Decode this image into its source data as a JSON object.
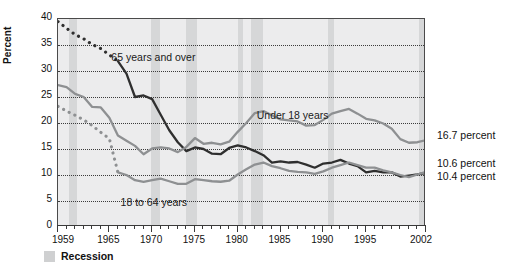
{
  "chart_data": {
    "type": "line",
    "title": "",
    "xlabel": "",
    "ylabel": "Percent",
    "ylim": [
      0,
      40
    ],
    "xlim": [
      1959,
      2002
    ],
    "ytick_labels": [
      "0",
      "5",
      "10",
      "15",
      "20",
      "25",
      "30",
      "35",
      "40"
    ],
    "ytick_values": [
      0,
      5,
      10,
      15,
      20,
      25,
      30,
      35,
      40
    ],
    "xtick_labels": [
      "1959",
      "1965",
      "1970",
      "1975",
      "1980",
      "1985",
      "1990",
      "1995",
      "2002"
    ],
    "xtick_values": [
      1959,
      1965,
      1970,
      1975,
      1980,
      1985,
      1990,
      1995,
      2002
    ],
    "grid": "horizontal-dotted",
    "legend_position": "below-axis",
    "x": [
      1959,
      1960,
      1961,
      1962,
      1963,
      1964,
      1965,
      1966,
      1967,
      1968,
      1969,
      1970,
      1971,
      1972,
      1973,
      1974,
      1975,
      1976,
      1977,
      1978,
      1979,
      1980,
      1981,
      1982,
      1983,
      1984,
      1985,
      1986,
      1987,
      1988,
      1989,
      1990,
      1991,
      1992,
      1993,
      1994,
      1995,
      1996,
      1997,
      1998,
      1999,
      2000,
      2001,
      2002
    ],
    "series": [
      {
        "name": "65 years and over",
        "color": "#2f2f2f",
        "style": "dotted-then-solid",
        "solid_from": 1966,
        "values": [
          39.5,
          38.2,
          37.0,
          36.2,
          35.1,
          34.3,
          33.1,
          31.9,
          29.5,
          25.0,
          25.3,
          24.6,
          21.6,
          18.6,
          16.3,
          14.6,
          15.3,
          15.0,
          14.1,
          14.0,
          15.2,
          15.7,
          15.3,
          14.6,
          13.8,
          12.4,
          12.6,
          12.4,
          12.5,
          12.0,
          11.4,
          12.2,
          12.4,
          12.9,
          12.2,
          11.7,
          10.5,
          10.8,
          10.5,
          10.5,
          9.7,
          9.9,
          10.1,
          10.4
        ],
        "end_label": "10.4 percent"
      },
      {
        "name": "Under 18 years",
        "color": "#8e9092",
        "style": "solid",
        "values": [
          27.3,
          26.9,
          25.6,
          25.0,
          23.1,
          23.0,
          21.0,
          17.6,
          16.6,
          15.6,
          14.0,
          15.1,
          15.3,
          15.1,
          14.4,
          15.4,
          17.1,
          16.0,
          16.2,
          15.9,
          16.4,
          18.3,
          20.0,
          21.9,
          22.3,
          21.5,
          20.7,
          20.5,
          20.3,
          19.5,
          19.6,
          20.6,
          21.8,
          22.3,
          22.7,
          21.8,
          20.8,
          20.5,
          19.9,
          18.9,
          16.9,
          16.2,
          16.3,
          16.7
        ],
        "end_label": "16.7 percent"
      },
      {
        "name": "18 to 64 years",
        "color": "#8e9092",
        "style": "dotted-then-solid",
        "solid_from": 1966,
        "values": [
          23.2,
          22.3,
          21.5,
          20.6,
          19.5,
          18.2,
          17.0,
          10.5,
          10.0,
          9.0,
          8.7,
          9.0,
          9.3,
          8.8,
          8.3,
          8.3,
          9.2,
          9.0,
          8.8,
          8.7,
          8.9,
          10.1,
          11.1,
          12.0,
          12.4,
          11.7,
          11.3,
          10.8,
          10.6,
          10.5,
          10.2,
          10.7,
          11.4,
          11.9,
          12.4,
          11.9,
          11.4,
          11.4,
          10.9,
          10.5,
          10.0,
          9.6,
          10.1,
          10.6
        ],
        "end_label": "10.6 percent"
      }
    ],
    "recession_bands": [
      {
        "start": 1960.3,
        "end": 1961.2
      },
      {
        "start": 1969.9,
        "end": 1970.9
      },
      {
        "start": 1973.9,
        "end": 1975.2
      },
      {
        "start": 1980.0,
        "end": 1980.6
      },
      {
        "start": 1981.5,
        "end": 1982.9
      },
      {
        "start": 1990.5,
        "end": 1991.2
      },
      {
        "start": 2001.2,
        "end": 2001.9
      }
    ],
    "annotations": [
      {
        "text": "65 years and over",
        "x_pct": 14.5,
        "y_pct": 15.5
      },
      {
        "text": "Under 18 years",
        "x_pct": 54.0,
        "y_pct": 43.5
      },
      {
        "text": "18 to 64 years",
        "x_pct": 17.0,
        "y_pct": 85.0
      }
    ],
    "right_labels": [
      {
        "text": "16.7 percent",
        "top_px": 129
      },
      {
        "text": "10.6 percent",
        "top_px": 157
      },
      {
        "text": "10.4 percent",
        "top_px": 170
      }
    ]
  },
  "legend": {
    "recession_label": "Recession",
    "recession_color": "#cfd0d1"
  }
}
